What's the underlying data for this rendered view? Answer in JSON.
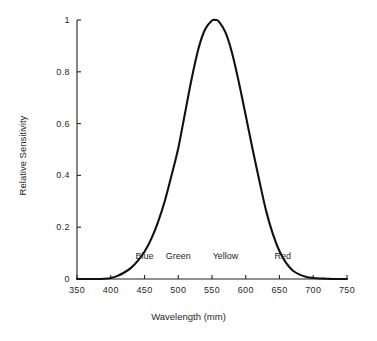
{
  "chart_data": {
    "type": "line",
    "title": "",
    "xlabel": "Wavelength (mm)",
    "ylabel": "Relative Sensitivity",
    "xlim": [
      350,
      750
    ],
    "ylim": [
      0,
      1
    ],
    "grid": false,
    "legend": "none",
    "x_ticks": [
      350,
      400,
      450,
      500,
      550,
      600,
      650,
      700,
      750
    ],
    "x_tick_labels": [
      "350",
      "400",
      "450",
      "500",
      "550",
      "600",
      "650",
      "700",
      "750"
    ],
    "y_ticks": [
      0,
      0.2,
      0.4,
      0.6,
      0.8,
      1
    ],
    "y_tick_labels": [
      "0",
      "0.2",
      "0.4",
      "0.6",
      "0.8",
      "1"
    ],
    "series": [
      {
        "name": "Photopic luminous efficiency",
        "x": [
          350,
          360,
          370,
          380,
          390,
          400,
          410,
          420,
          430,
          440,
          450,
          460,
          470,
          480,
          490,
          500,
          510,
          520,
          530,
          540,
          550,
          555,
          560,
          570,
          580,
          590,
          600,
          610,
          620,
          630,
          640,
          650,
          660,
          670,
          680,
          690,
          700,
          710,
          720,
          730,
          740,
          750
        ],
        "y": [
          0.0,
          0.0,
          0.0,
          0.0,
          0.001,
          0.004,
          0.012,
          0.025,
          0.043,
          0.07,
          0.105,
          0.155,
          0.22,
          0.3,
          0.4,
          0.505,
          0.64,
          0.775,
          0.89,
          0.965,
          0.998,
          1.0,
          0.995,
          0.952,
          0.87,
          0.757,
          0.631,
          0.503,
          0.381,
          0.265,
          0.175,
          0.107,
          0.061,
          0.032,
          0.017,
          0.008,
          0.004,
          0.002,
          0.001,
          0.0,
          0.0,
          0.0
        ]
      }
    ],
    "annotations": [
      {
        "text": "Blue",
        "x": 450,
        "y": 0.085
      },
      {
        "text": "Green",
        "x": 500,
        "y": 0.085
      },
      {
        "text": "Yellow",
        "x": 570,
        "y": 0.085
      },
      {
        "text": "Red",
        "x": 655,
        "y": 0.085
      }
    ],
    "colors": {
      "background": "#ffffff",
      "curve": "#111111",
      "axis": "#222222",
      "text": "#1f1f1f"
    }
  }
}
